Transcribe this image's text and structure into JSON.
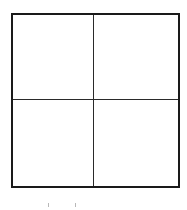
{
  "diagram": {
    "type": "2x2 grid",
    "rows": 2,
    "columns": 2,
    "border_color": "#1a1a1a",
    "divider_color": "#2a2a2a",
    "background": "#ffffff",
    "cells": [
      {
        "row": 0,
        "col": 0,
        "label": ""
      },
      {
        "row": 0,
        "col": 1,
        "label": ""
      },
      {
        "row": 1,
        "col": 0,
        "label": ""
      },
      {
        "row": 1,
        "col": 1,
        "label": ""
      }
    ],
    "bottom_marks": [
      {
        "x": 48,
        "color": "#b8b8b8"
      },
      {
        "x": 75,
        "color": "#b8b8b8"
      }
    ]
  }
}
